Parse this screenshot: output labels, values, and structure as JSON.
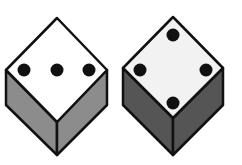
{
  "figure": {
    "colors": {
      "top_face_left": "#ffffff",
      "top_face_right": "#f2f2f2",
      "side_left_die": "#8c8c8c",
      "side_right_die": "#555555",
      "outline": "#111111",
      "pip": "#111111"
    },
    "dice": [
      {
        "name": "left-die",
        "top_face_pips": 3
      },
      {
        "name": "right-die",
        "top_face_pips": 4
      }
    ]
  }
}
